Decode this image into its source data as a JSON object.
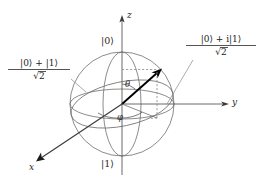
{
  "figure": {
    "kind": "bloch-sphere-diagram",
    "background_color": "#ffffff",
    "line_color": "#6b6b6b",
    "vector_color": "#000000",
    "text_color": "#2a2a2a"
  },
  "axes": {
    "z": {
      "label": "z",
      "direction": "up",
      "arrow": true
    },
    "y": {
      "label": "y",
      "direction": "right",
      "arrow": true
    },
    "x": {
      "label": "x",
      "direction": "down-left",
      "arrow": true
    }
  },
  "poles": {
    "north_label": "|0⟩",
    "south_label": "|1⟩"
  },
  "angles": {
    "polar_label": "θ",
    "azimuth_label": "φ"
  },
  "callouts": [
    {
      "id": "plus-state",
      "numerator": "|0⟩ + |1⟩",
      "radical": "√",
      "radicand": "2",
      "denominator": "√2",
      "side": "left"
    },
    {
      "id": "plus-i-state",
      "numerator": "|0⟩ + i|1⟩",
      "radical": "√",
      "radicand": "2",
      "denominator": "√2",
      "side": "right"
    }
  ],
  "state_vector": {
    "description": "arrow from origin to point on sphere surface",
    "has_dashed_projection": true
  }
}
